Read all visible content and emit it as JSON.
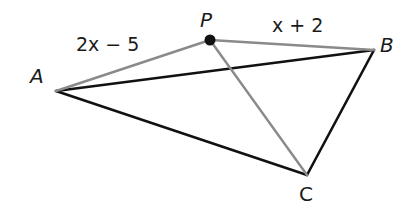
{
  "diagram": {
    "type": "geometry",
    "points": {
      "A": {
        "label": "A",
        "x": 56,
        "y": 91
      },
      "B": {
        "label": "B",
        "x": 374,
        "y": 50
      },
      "C": {
        "label": "C",
        "x": 307,
        "y": 175
      },
      "P": {
        "label": "P",
        "x": 210,
        "y": 40
      }
    },
    "segments": [
      {
        "from": "A",
        "to": "B",
        "style": "black"
      },
      {
        "from": "B",
        "to": "C",
        "style": "black"
      },
      {
        "from": "A",
        "to": "C",
        "style": "black"
      },
      {
        "from": "A",
        "to": "P",
        "style": "gray"
      },
      {
        "from": "P",
        "to": "B",
        "style": "gray"
      },
      {
        "from": "P",
        "to": "C",
        "style": "gray"
      }
    ],
    "segment_labels": {
      "AP": "2x − 5",
      "PB": "x + 2"
    },
    "colors": {
      "black_line": "#111111",
      "gray_line": "#8a8a8a",
      "point_dot": "#111111"
    }
  }
}
